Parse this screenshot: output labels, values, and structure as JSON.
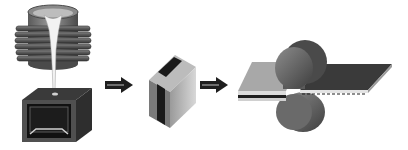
{
  "diagram": {
    "stages": [
      {
        "id": "casting",
        "label": ""
      },
      {
        "id": "ingot",
        "label": ""
      },
      {
        "id": "rolling",
        "label": ""
      }
    ],
    "arrows": 2,
    "colors": {
      "background": "#ffffff",
      "dark": "#2a2a2a",
      "mid_gray": "#6e6e6e",
      "light_gray": "#c8c8c8",
      "molten_metal": "#f0f0f0",
      "arrow": "#1e1e1e"
    }
  }
}
